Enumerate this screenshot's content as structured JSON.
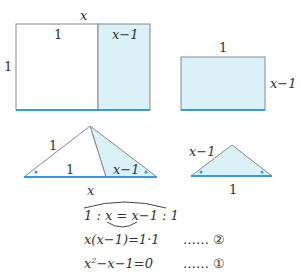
{
  "colors": {
    "fill": "#d9f1f7",
    "line": "#888888",
    "accent": "#3a9ad9"
  },
  "rect_big": {
    "top_label": "x",
    "left_label": "1",
    "inner_left": "1",
    "inner_right": "x−1"
  },
  "rect_small": {
    "top_label": "1",
    "right_label": "x−1"
  },
  "tri_big": {
    "side_label": "1",
    "base_left": "1",
    "base_right": "x−1",
    "below": "x"
  },
  "tri_small": {
    "side_label": "x−1",
    "below": "1"
  },
  "equations": {
    "ratio": "1 : x = x−1 : 1",
    "eq2": "x(x−1)=1·1",
    "eq2_tag": "…… ②",
    "eq1_a": "x",
    "eq1_sup": "2",
    "eq1_b": "−x−1=0",
    "eq1_tag": "…… ①"
  }
}
